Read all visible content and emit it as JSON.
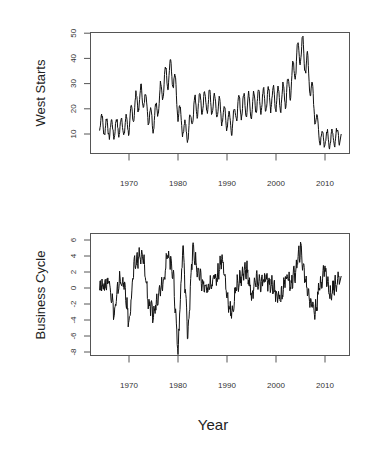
{
  "chart_data": [
    {
      "type": "line",
      "title": "",
      "xlabel": "",
      "ylabel": "West Starts",
      "xlim": [
        1963.5,
        2014.2
      ],
      "ylim": [
        3,
        51
      ],
      "xticks": [
        1970,
        1980,
        1990,
        2000,
        2010
      ],
      "yticks": [
        10,
        20,
        30,
        40,
        50
      ],
      "grid": false,
      "legend": null,
      "series": [
        {
          "name": "West Starts",
          "x": [
            1964,
            1965,
            1966,
            1967,
            1968,
            1969,
            1970,
            1971,
            1972,
            1973,
            1974,
            1975,
            1976,
            1977,
            1978,
            1979,
            1980,
            1981,
            1982,
            1983,
            1984,
            1985,
            1986,
            1987,
            1988,
            1989,
            1990,
            1991,
            1992,
            1993,
            1994,
            1995,
            1996,
            1997,
            1998,
            1999,
            2000,
            2001,
            2002,
            2003,
            2004,
            2005,
            2006,
            2007,
            2008,
            2009,
            2010,
            2011,
            2012,
            2013
          ],
          "y": [
            15,
            13,
            12,
            12,
            13,
            13,
            14,
            20,
            24,
            25,
            18,
            15,
            22,
            30,
            33,
            34,
            20,
            13,
            10,
            19,
            22,
            22,
            23,
            22,
            21,
            18,
            16,
            14,
            20,
            21,
            22,
            21,
            23,
            23,
            24,
            24,
            24,
            24,
            26,
            30,
            38,
            44,
            40,
            30,
            18,
            9,
            8,
            8,
            8,
            10
          ],
          "seasonal_amplitude": 4
        }
      ]
    },
    {
      "type": "line",
      "title": "",
      "xlabel": "Year",
      "ylabel": "Business Cycle",
      "xlim": [
        1963.5,
        2014.2
      ],
      "ylim": [
        -8.3,
        6.5
      ],
      "xticks": [
        1970,
        1980,
        1990,
        2000,
        2010
      ],
      "yticks": [
        -8,
        -6,
        -4,
        -2,
        0,
        2,
        4,
        6
      ],
      "grid": false,
      "legend": null,
      "series": [
        {
          "name": "Business Cycle",
          "x": [
            1964,
            1965,
            1966,
            1967,
            1968,
            1969,
            1970,
            1971,
            1972,
            1973,
            1974,
            1975,
            1976,
            1977,
            1978,
            1979,
            1980,
            1981,
            1982,
            1983,
            1984,
            1985,
            1986,
            1987,
            1988,
            1989,
            1990,
            1991,
            1992,
            1993,
            1994,
            1995,
            1996,
            1997,
            1998,
            1999,
            2000,
            2001,
            2002,
            2003,
            2004,
            2005,
            2006,
            2007,
            2008,
            2009,
            2010,
            2011,
            2012,
            2013
          ],
          "y": [
            0.5,
            0.3,
            1.0,
            -3.5,
            1.0,
            0.5,
            -4.5,
            2.5,
            4.0,
            3.5,
            -2.0,
            -3.5,
            -0.5,
            1.0,
            4.5,
            2.0,
            -8.0,
            5.5,
            -6.0,
            5.0,
            2.0,
            0.5,
            -0.5,
            1.0,
            1.5,
            4.0,
            -1.0,
            -3.5,
            0.5,
            1.5,
            2.5,
            -1.0,
            1.0,
            0.5,
            1.0,
            0.5,
            -0.5,
            -1.5,
            1.5,
            0.5,
            2.0,
            5.0,
            1.0,
            -1.5,
            -3.0,
            0.5,
            2.5,
            -1.0,
            0.5,
            1.5
          ]
        }
      ]
    }
  ],
  "top_panel": {
    "ylabel": "West Starts",
    "xtick_labels": [
      "1970",
      "1980",
      "1990",
      "2000",
      "2010"
    ],
    "ytick_labels": [
      "10",
      "20",
      "30",
      "40",
      "50"
    ]
  },
  "bottom_panel": {
    "ylabel": "Business Cycle",
    "xtick_labels": [
      "1970",
      "1980",
      "1990",
      "2000",
      "2010"
    ],
    "ytick_labels": [
      "-8",
      "-6",
      "-4",
      "-2",
      "0",
      "2",
      "4",
      "6"
    ]
  },
  "xlabel": "Year"
}
